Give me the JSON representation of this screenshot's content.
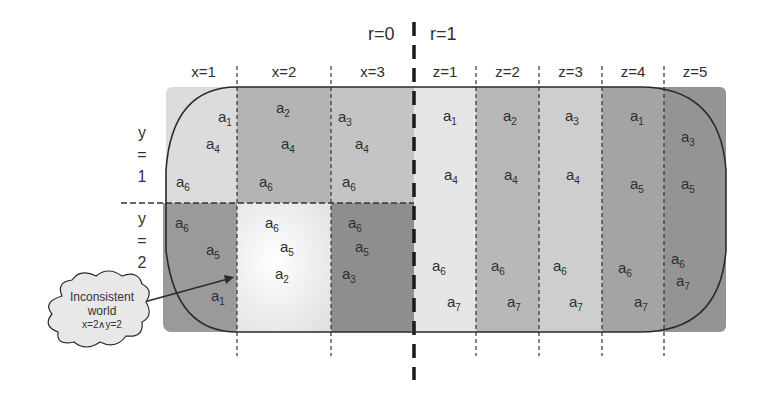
{
  "headers": {
    "r0": "r=0",
    "r1": "r=1",
    "x_cols": [
      "x=1",
      "x=2",
      "x=3"
    ],
    "z_cols": [
      "z=1",
      "z=2",
      "z=3",
      "z=4",
      "z=5"
    ],
    "y_rows": [
      {
        "line1": "y",
        "line2": "=",
        "line3": "1"
      },
      {
        "line1": "y",
        "line2": "=",
        "line3": "2"
      }
    ]
  },
  "colors": {
    "x1y1": "#dcdcdc",
    "x2y1": "#b4b4b4",
    "x3y1": "#c4c4c4",
    "x1y2": "#9a9a9a",
    "x2y2": "#f2f2f2",
    "x3y2": "#8e8e8e",
    "z1": "#e6e6e6",
    "z2": "#b8b8b8",
    "z3": "#cecece",
    "z4": "#a4a4a4",
    "z5": "#949494",
    "outline": "#2a2a2a"
  },
  "cells": {
    "x1y1": [
      "a1",
      "a4",
      "a6"
    ],
    "x2y1": [
      "a2",
      "a4",
      "a6"
    ],
    "x3y1": [
      "a3",
      "a4",
      "a6"
    ],
    "x1y2": [
      "a6",
      "a5",
      "a1"
    ],
    "x2y2": [
      "a6",
      "a5",
      "a2"
    ],
    "x3y2": [
      "a6",
      "a5",
      "a3"
    ],
    "z1": [
      "a1",
      "a4",
      "a6",
      "a7"
    ],
    "z2": [
      "a2",
      "a4",
      "a6",
      "a7"
    ],
    "z3": [
      "a3",
      "a4",
      "a6",
      "a7"
    ],
    "z4": [
      "a1",
      "a5",
      "a6",
      "a7"
    ],
    "z5": [
      "a3",
      "a5",
      "a6",
      "a7"
    ]
  },
  "callout": {
    "line1": "Inconsistent",
    "line2": "world",
    "line3": "x=2∧y=2"
  }
}
